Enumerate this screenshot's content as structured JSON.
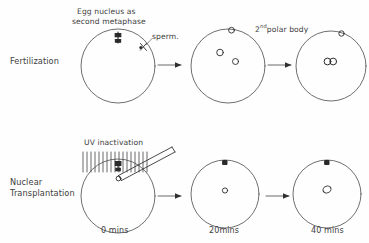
{
  "figure": {
    "background_color": "#fefefe",
    "ink_color": "#3a3a3a",
    "style": "hand-drawn line diagram"
  },
  "rows": [
    {
      "id": "fertilization",
      "label": "Fertilization",
      "annotations": [
        {
          "id": "egg-nucleus",
          "line1": "Egg nucleus as",
          "line2": "second metaphase"
        },
        {
          "id": "sperm",
          "text": "sperm."
        },
        {
          "id": "polar-body",
          "text_main": "polar body",
          "prefix": "2",
          "superscript": "nd"
        }
      ],
      "stages": [
        {
          "id": "stage-1",
          "contents": "egg with metaphase spindle and sperm entry point"
        },
        {
          "id": "stage-2",
          "contents": "two pronuclei and second polar body"
        },
        {
          "id": "stage-3",
          "contents": "fused pronuclei and second polar body"
        }
      ]
    },
    {
      "id": "nuclear-transplantation",
      "label_line1": "Nuclear",
      "label_line2": "Transplantation",
      "annotations": [
        {
          "id": "uv-inactivation",
          "text": "UV inactivation"
        }
      ],
      "stages": [
        {
          "id": "stage-1",
          "contents": "UV irradiated egg with injection micropipette carrying donor nucleus"
        },
        {
          "id": "stage-2",
          "contents": "egg with small transplanted nucleus"
        },
        {
          "id": "stage-3",
          "contents": "egg with enlarged transplanted nucleus"
        }
      ]
    }
  ],
  "timeline": {
    "labels": [
      {
        "id": "t0",
        "text": "0 mins"
      },
      {
        "id": "t20",
        "text": "20mins"
      },
      {
        "id": "t40",
        "text": "40 mins"
      }
    ]
  }
}
